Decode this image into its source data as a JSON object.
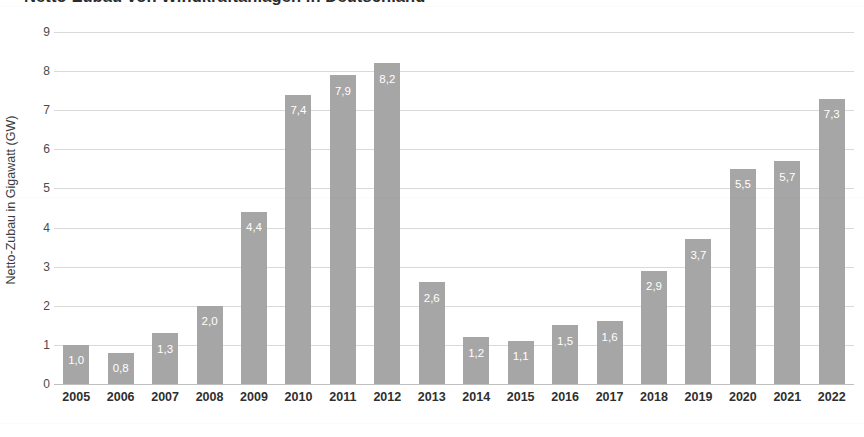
{
  "chart_data": {
    "type": "bar",
    "title": "Netto-Zubau von Windkraftanlagen in Deutschland",
    "xlabel": "",
    "ylabel": "Netto-Zubau in Gigawatt (GW)",
    "ylim": [
      0,
      9
    ],
    "y_ticks": [
      "0",
      "1",
      "2",
      "3",
      "4",
      "5",
      "6",
      "7",
      "8",
      "9"
    ],
    "grid": true,
    "legend": null,
    "bar_color": "#a6a6a6",
    "value_label_color": "#ffffff",
    "gridline_color": "#d9d9d9",
    "decimal_separator": ",",
    "categories": [
      "2005",
      "2006",
      "2007",
      "2008",
      "2009",
      "2010",
      "2011",
      "2012",
      "2013",
      "2014",
      "2015",
      "2016",
      "2017",
      "2018",
      "2019",
      "2020",
      "2021",
      "2022"
    ],
    "values": [
      1.0,
      0.8,
      1.3,
      2.0,
      4.4,
      7.4,
      7.9,
      8.2,
      2.6,
      1.2,
      1.1,
      1.5,
      1.6,
      2.9,
      3.7,
      5.5,
      5.7,
      7.3
    ],
    "value_labels": [
      "1,0",
      "0,8",
      "1,3",
      "2,0",
      "4,4",
      "7,4",
      "7,9",
      "8,2",
      "2,6",
      "1,2",
      "1,1",
      "1,5",
      "1,6",
      "2,9",
      "3,7",
      "5,5",
      "5,7",
      "7,3"
    ]
  }
}
